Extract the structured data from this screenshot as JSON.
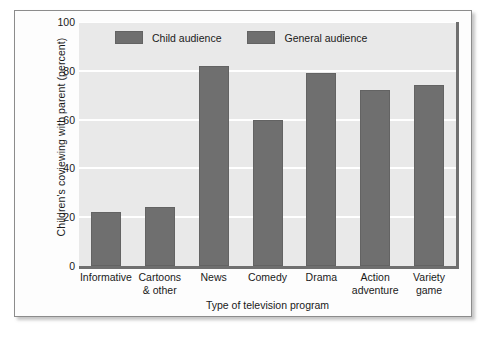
{
  "chart_data": {
    "type": "bar",
    "title": "",
    "xlabel": "Type of television program",
    "ylabel": "Children's coviewing with parent (percent)",
    "categories": [
      "Informative",
      "Cartoons & other",
      "News",
      "Comedy",
      "Drama",
      "Action adventure",
      "Variety game"
    ],
    "category_lines": [
      [
        "Informative"
      ],
      [
        "Cartoons",
        "& other"
      ],
      [
        "News"
      ],
      [
        "Comedy"
      ],
      [
        "Drama"
      ],
      [
        "Action",
        "adventure"
      ],
      [
        "Variety",
        "game"
      ]
    ],
    "values": [
      22,
      24,
      82,
      60,
      79,
      72,
      74
    ],
    "groups": [
      "Child audience",
      "Child audience",
      "General audience",
      "General audience",
      "General audience",
      "General audience",
      "General audience"
    ],
    "ylim": [
      0,
      100
    ],
    "yticks": [
      0,
      20,
      40,
      60,
      80,
      100
    ],
    "ytick_labels": [
      "0",
      "20",
      "40",
      "60",
      "80",
      "100"
    ],
    "grid": true,
    "legend_position": "top-center",
    "legend": [
      {
        "label": "Child audience",
        "color": "#6f6f6f"
      },
      {
        "label": "General audience",
        "color": "#6f6f6f"
      }
    ],
    "colors": {
      "bar": "#6f6f6f",
      "plot_background": "#e9e9e9",
      "gridline": "#ffffff",
      "axis": "#6f6f6f",
      "text": "#1a1a1a"
    }
  }
}
